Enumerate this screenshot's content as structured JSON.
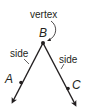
{
  "diagram": {
    "labels": {
      "vertex": "vertex",
      "point_b": "B",
      "point_a": "A",
      "point_c": "C",
      "side_left": "side",
      "side_right": "side"
    },
    "colors": {
      "line": "#231f20",
      "text": "#231f20",
      "background": "#ffffff"
    }
  }
}
